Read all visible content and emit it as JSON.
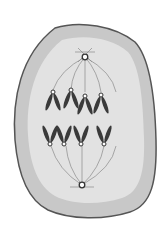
{
  "figure": {
    "colors": {
      "background": "#ffffff",
      "cell_outline": "#555555",
      "cytoplasm_outer": "#c8c8c8",
      "cytoplasm_inner": "#e4e4e4",
      "spindle": "#8a8a8a",
      "chromosome": "#3a3a3a",
      "centrosome": "#333333"
    },
    "chromosome_count_top": 4,
    "chromosome_count_bottom": 4
  }
}
